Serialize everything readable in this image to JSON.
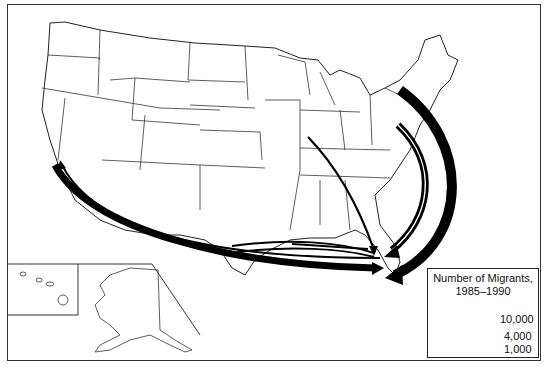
{
  "map": {
    "subject": "Migration flows to Florida",
    "destination": "Florida",
    "insets": [
      "Hawaii",
      "Alaska"
    ]
  },
  "legend": {
    "title_line1": "Number of Migrants,",
    "title_line2": "1985–1990",
    "items": [
      {
        "label": "10,000",
        "value": 10000
      },
      {
        "label": "4,000",
        "value": 4000
      },
      {
        "label": "1,000",
        "value": 1000
      }
    ]
  },
  "flows": [
    {
      "origin": "New York (Northeast)",
      "destination": "Florida",
      "weight": "large"
    },
    {
      "origin": "New Jersey / Mid-Atlantic",
      "destination": "Florida",
      "weight": "medium"
    },
    {
      "origin": "California",
      "destination": "Florida",
      "weight": "medium"
    },
    {
      "origin": "Texas",
      "destination": "Florida",
      "weight": "small"
    },
    {
      "origin": "Louisiana",
      "destination": "Florida",
      "weight": "small"
    },
    {
      "origin": "Illinois / Indiana",
      "destination": "Florida",
      "weight": "small"
    },
    {
      "origin": "Florida",
      "destination": "California",
      "weight": "small"
    }
  ],
  "colors": {
    "arrow": "#000000",
    "border": "#333333",
    "background": "#ffffff"
  }
}
